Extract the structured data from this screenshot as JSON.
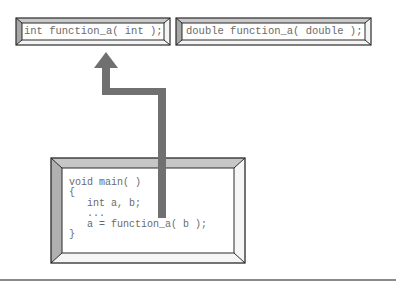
{
  "diagram": {
    "prototypes": [
      {
        "text": "int function_a( int );"
      },
      {
        "text": "double function_a( double );"
      }
    ],
    "main_code": {
      "lines": [
        "void main( )",
        "{",
        "   int a, b;",
        "   ...",
        "   a = function_a( b );",
        "}"
      ]
    },
    "arrow": {
      "from": "main_code.call",
      "to": "prototypes.0",
      "color": "#707070"
    },
    "colors": {
      "bevel_light": "#d8d8d8",
      "bevel_dark": "#9a9a9a",
      "outline": "#2a2a2a",
      "text": "#6a6a6a",
      "baseline": "#8a8a8a"
    }
  }
}
